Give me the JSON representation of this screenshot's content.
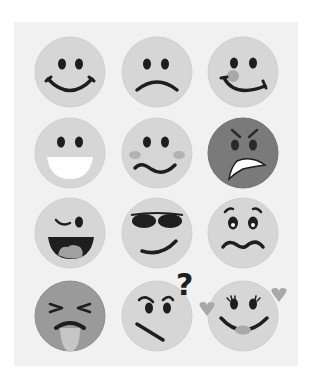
{
  "colors": {
    "background": "#ffffff",
    "panel": "#f1f1f1",
    "face_light": "#d6d6d6",
    "face_dark": "#7a7a7a",
    "face_mid": "#9a9a9a",
    "feature": "#1e1e1e",
    "accent_gray": "#a8a8a8"
  },
  "grid": {
    "columns": 3,
    "rows": 4,
    "faces": [
      {
        "name": "happy",
        "icon": "smiling-face-icon"
      },
      {
        "name": "sad",
        "icon": "sad-face-icon"
      },
      {
        "name": "blushing-smile",
        "icon": "blushing-smile-face-icon"
      },
      {
        "name": "grinning",
        "icon": "grinning-face-icon"
      },
      {
        "name": "confused-blush",
        "icon": "wavy-mouth-face-icon"
      },
      {
        "name": "angry",
        "icon": "angry-face-icon"
      },
      {
        "name": "winking",
        "icon": "winking-face-icon"
      },
      {
        "name": "cool",
        "icon": "sunglasses-face-icon"
      },
      {
        "name": "worried",
        "icon": "worried-face-icon"
      },
      {
        "name": "sick",
        "icon": "vomiting-face-icon"
      },
      {
        "name": "questioning",
        "icon": "questioning-face-icon"
      },
      {
        "name": "in-love",
        "icon": "hearts-face-icon"
      }
    ]
  },
  "question_mark": "?"
}
